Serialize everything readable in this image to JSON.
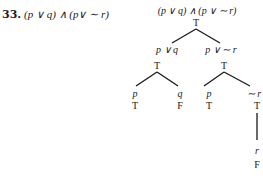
{
  "problem": {
    "number": "33.",
    "formula": "(p ∨ q) ∧ (p∨ ∼ r)"
  },
  "tree": {
    "root": {
      "formula": "(p ∨ q) ∧ (p ∨ ∼ r)",
      "value": "T"
    },
    "left": {
      "formula": "p ∨ q",
      "value": "T",
      "children": [
        {
          "formula": "p",
          "value": "T"
        },
        {
          "formula": "q",
          "value": "F"
        }
      ]
    },
    "right": {
      "formula": "p ∨ ∼ r",
      "value": "T",
      "children": [
        {
          "formula": "p",
          "value": "T"
        },
        {
          "formula": "∼ r",
          "value": "T"
        }
      ]
    },
    "negation_child": {
      "formula": "r",
      "value": "F"
    }
  }
}
